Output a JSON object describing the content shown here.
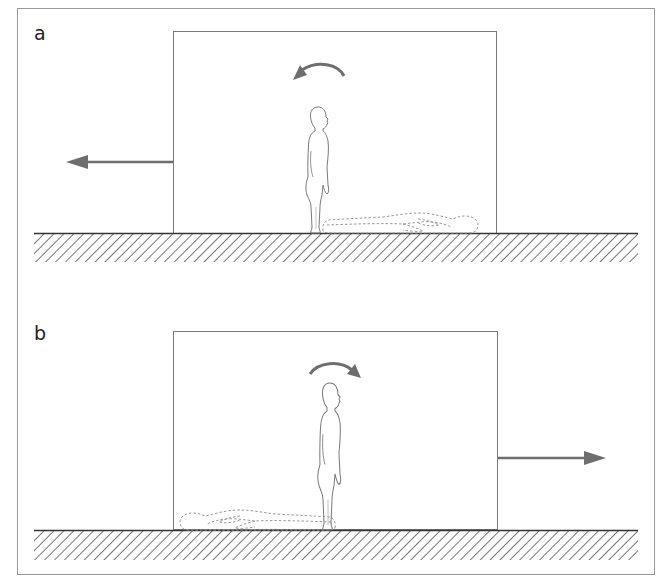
{
  "figure": {
    "colors": {
      "outline": "#7a7a7a",
      "arrow": "#6e6e6e",
      "ground": "#333333",
      "hatch": "#555555",
      "dashed": "#9a9a9a"
    },
    "panels": [
      {
        "label": "a",
        "box_motion": "left",
        "rotation": "counter-clockwise",
        "fallen_direction": "backward (right side)"
      },
      {
        "label": "b",
        "box_motion": "right",
        "rotation": "clockwise",
        "fallen_direction": "backward (left side)"
      }
    ]
  }
}
